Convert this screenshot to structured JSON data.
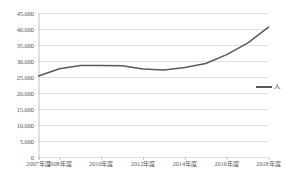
{
  "chart_data": {
    "type": "line",
    "title": "",
    "subtitle": "",
    "xlabel": "",
    "ylabel": "",
    "categories": [
      "2007年度",
      "2008年度",
      "2009年度",
      "2010年度",
      "2011年度",
      "2012年度",
      "2013年度",
      "2014年度",
      "2015年度",
      "2016年度",
      "2017年度",
      "2018年度"
    ],
    "tick_labels": [
      "2007年度",
      "2008年度",
      "2010年度",
      "2012年度",
      "2014年度",
      "2016年度",
      "2018年度"
    ],
    "series": [
      {
        "name": "人",
        "values": [
          25300,
          27600,
          28600,
          28600,
          28500,
          27500,
          27200,
          28000,
          29200,
          32000,
          35600,
          40600
        ],
        "color": "#595959"
      }
    ],
    "ylim": [
      0,
      45000
    ],
    "y_ticks": [
      0,
      5000,
      10000,
      15000,
      20000,
      25000,
      30000,
      35000,
      40000,
      45000
    ],
    "y_tick_labels": [
      "0",
      "5,000",
      "10,000",
      "15,000",
      "20,000",
      "25,000",
      "30,000",
      "35,000",
      "40,000",
      "45,000"
    ],
    "grid": true,
    "grid_axis": "y",
    "grid_color": "#d9d9d9",
    "axis_color": "#bfbfbf",
    "legend": {
      "position": "right",
      "entries": [
        {
          "label": "人",
          "color": "#595959"
        }
      ]
    }
  },
  "caption": ""
}
